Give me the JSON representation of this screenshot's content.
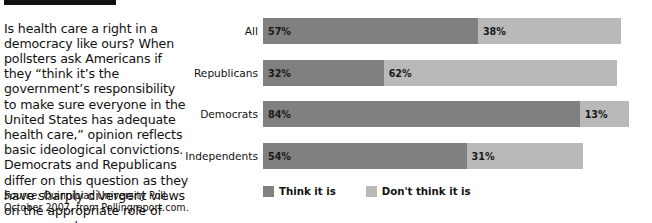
{
  "article": {
    "body": "Is health care a right in a democracy like ours? When pollsters ask Americans if they “think it’s the government’s responsibility to make sure everyone in the United States has adequate health care,” opinion reflects basic ideological convictions. Democrats and Republicans differ on this question as they have sharply divergent views on the appropriate role of government.",
    "source_lead": "Source:",
    "source_rest": " Quinnipiac University Poll, October 2007, from Pollingreport.com."
  },
  "chart_data": {
    "type": "bar",
    "orientation": "horizontal",
    "stacked": true,
    "title": "",
    "xlabel": "",
    "ylabel": "",
    "xlim": [
      0,
      100
    ],
    "grid": false,
    "legend_position": "bottom-left",
    "categories": [
      "All",
      "Republicans",
      "Democrats",
      "Independents"
    ],
    "series": [
      {
        "name": "Think it is",
        "color": "#808080",
        "values": [
          57,
          32,
          84,
          54
        ],
        "labels": [
          "57%",
          "32%",
          "84%",
          "54%"
        ]
      },
      {
        "name": "Don't think it is",
        "color": "#b9b9b9",
        "values": [
          38,
          62,
          13,
          31
        ],
        "labels": [
          "38%",
          "62%",
          "13%",
          "31%"
        ]
      }
    ]
  },
  "colors": {
    "think_it_is": "#808080",
    "dont_think_it_is": "#b9b9b9",
    "rule": "#111111",
    "text": "#111111"
  }
}
